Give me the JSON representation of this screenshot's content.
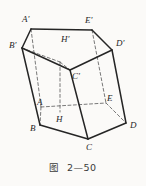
{
  "figure": {
    "caption": "图  2—50",
    "colors": {
      "stroke": "#252525",
      "hidden_stroke": "#6a6a6a",
      "background": "#fbfaf8",
      "label": "#1f1f1f"
    },
    "vertices": {
      "A_prime": {
        "label": "A'",
        "x": 31,
        "y": 29,
        "lx": 22,
        "ly": 22
      },
      "E_prime": {
        "label": "E'",
        "x": 92,
        "y": 30,
        "lx": 85,
        "ly": 23
      },
      "D_prime": {
        "label": "D'",
        "x": 112,
        "y": 50,
        "lx": 116,
        "ly": 46
      },
      "B_prime": {
        "label": "B'",
        "x": 22,
        "y": 48,
        "lx": 9,
        "ly": 48
      },
      "C_prime": {
        "label": "C'",
        "x": 70,
        "y": 70,
        "lx": 72,
        "ly": 79
      },
      "H_prime": {
        "label": "H'",
        "x": 60,
        "y": 62,
        "lx": 61,
        "ly": 42
      },
      "A": {
        "label": "A",
        "x": 41,
        "y": 107,
        "lx": 37,
        "ly": 105
      },
      "E": {
        "label": "E",
        "x": 106,
        "y": 103,
        "lx": 107,
        "ly": 101
      },
      "D": {
        "label": "D",
        "x": 126,
        "y": 123,
        "lx": 130,
        "ly": 128
      },
      "B": {
        "label": "B",
        "x": 40,
        "y": 125,
        "lx": 30,
        "ly": 131
      },
      "C": {
        "label": "C",
        "x": 88,
        "y": 139,
        "lx": 86,
        "ly": 150
      },
      "H": {
        "label": "H",
        "x": 60,
        "y": 112,
        "lx": 56,
        "ly": 122
      }
    },
    "solid_edges": [
      {
        "name": "edge-Ap-Ep",
        "from": "A_prime",
        "to": "E_prime"
      },
      {
        "name": "edge-Ep-Dp",
        "from": "E_prime",
        "to": "D_prime"
      },
      {
        "name": "edge-Dp-Cp",
        "from": "D_prime",
        "to": "C_prime"
      },
      {
        "name": "edge-Cp-Bp",
        "from": "C_prime",
        "to": "B_prime"
      },
      {
        "name": "edge-Bp-Ap",
        "from": "B_prime",
        "to": "A_prime"
      },
      {
        "name": "edge-Bp-B",
        "from": "B_prime",
        "to": "B"
      },
      {
        "name": "edge-Cp-C",
        "from": "C_prime",
        "to": "C"
      },
      {
        "name": "edge-Dp-D",
        "from": "D_prime",
        "to": "D"
      },
      {
        "name": "edge-B-C",
        "from": "B",
        "to": "C"
      },
      {
        "name": "edge-C-D",
        "from": "C",
        "to": "D"
      }
    ],
    "hidden_edges": [
      {
        "name": "edge-Ap-A",
        "from": "A_prime",
        "to": "A"
      },
      {
        "name": "edge-Ep-E",
        "from": "E_prime",
        "to": "E"
      },
      {
        "name": "edge-Hp-H",
        "from": "H_prime",
        "to": "H"
      },
      {
        "name": "edge-A-B",
        "from": "A",
        "to": "B"
      },
      {
        "name": "edge-A-E",
        "from": "A",
        "to": "E"
      },
      {
        "name": "edge-E-D",
        "from": "E",
        "to": "D"
      },
      {
        "name": "edge-Bp-Hp",
        "from": "B_prime",
        "to": "H_prime"
      },
      {
        "name": "edge-Hp-Cp",
        "from": "H_prime",
        "to": "C_prime"
      }
    ]
  }
}
